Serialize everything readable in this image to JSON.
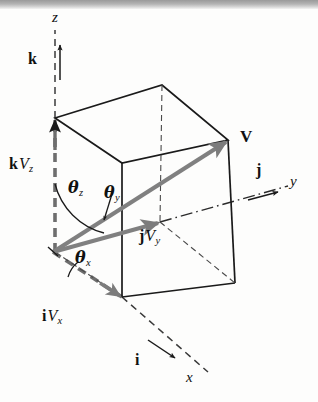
{
  "figure": {
    "type": "vector-decomposition-diagram",
    "colors": {
      "background": "#fdfdfc",
      "box_edge": "#1a1a1a",
      "vector_gray": "#808080",
      "axis_dash": "#2b2b2b",
      "text": "#111111"
    }
  },
  "axes": [
    {
      "id": "z",
      "label": "z",
      "style": "italic",
      "direction": "up"
    },
    {
      "id": "y",
      "label": "y",
      "style": "italic",
      "direction": "right"
    },
    {
      "id": "x",
      "label": "x",
      "style": "italic",
      "direction": "lower-right"
    }
  ],
  "unit_vectors": [
    {
      "id": "k",
      "label": "k",
      "style": "bold",
      "axis": "z"
    },
    {
      "id": "j",
      "label": "j",
      "style": "bold",
      "axis": "y"
    },
    {
      "id": "i",
      "label": "i",
      "style": "bold",
      "axis": "x"
    }
  ],
  "components": [
    {
      "id": "kVz",
      "unit": "k",
      "magnitude": "V",
      "subscript": "z"
    },
    {
      "id": "jVy",
      "unit": "j",
      "magnitude": "V",
      "subscript": "y"
    },
    {
      "id": "iVx",
      "unit": "i",
      "magnitude": "V",
      "subscript": "x"
    }
  ],
  "resultant": {
    "id": "V",
    "label": "V",
    "style": "bold"
  },
  "angles": [
    {
      "id": "theta_z",
      "symbol": "θ",
      "subscript": "z",
      "between": "V and z-axis"
    },
    {
      "id": "theta_y",
      "symbol": "θ",
      "subscript": "y",
      "between": "V and y-axis"
    },
    {
      "id": "theta_x",
      "symbol": "θ",
      "subscript": "x",
      "between": "V and x-axis"
    }
  ],
  "geometry": {
    "origin": [
      53,
      252
    ],
    "top_left_vertex": [
      55,
      118
    ],
    "top_back_vertex": [
      162,
      85
    ],
    "top_right_vertex": [
      228,
      140
    ],
    "top_front_vertex": [
      122,
      163
    ],
    "front_bottom_left": [
      122,
      297
    ],
    "front_bottom_right": [
      235,
      283
    ],
    "back_bottom_right": [
      228,
      228
    ],
    "V_tip": [
      228,
      140
    ],
    "jVy_tip": [
      160,
      222
    ]
  }
}
